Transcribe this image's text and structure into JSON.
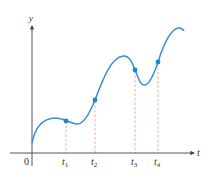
{
  "diagram": {
    "type": "function-graph",
    "axes": {
      "x_label": "t",
      "y_label": "y",
      "origin_label": "0"
    },
    "marked_points": [
      {
        "label": "t",
        "sub": "1"
      },
      {
        "label": "t",
        "sub": "2"
      },
      {
        "label": "t",
        "sub": "3"
      },
      {
        "label": "t",
        "sub": "4"
      }
    ],
    "colors": {
      "curve": "#3b8fd1",
      "points": "#1f86cc",
      "dashed_lines": "#e8a48a",
      "axes": "#444444"
    }
  }
}
